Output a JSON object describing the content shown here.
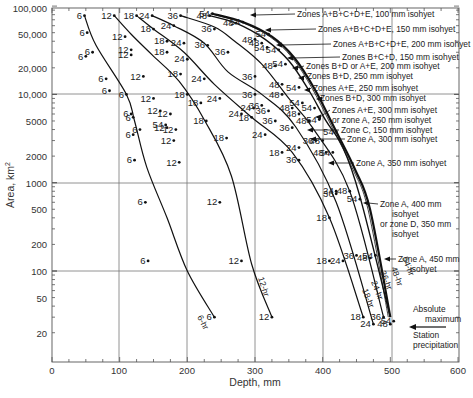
{
  "chart_data": {
    "type": "line",
    "title": "",
    "xlabel": "Depth, mm",
    "ylabel": "Area, km²",
    "xlim": [
      0,
      600
    ],
    "ylim": [
      10,
      100000
    ],
    "yscale": "log",
    "grid": true,
    "x_ticks": [
      "0",
      "100",
      "200",
      "300",
      "400",
      "500",
      "600"
    ],
    "y_ticks": [
      "100,000",
      "50,000",
      "20,000",
      "10,000",
      "5000",
      "2000",
      "1000",
      "500",
      "200",
      "100",
      "50",
      "20"
    ],
    "series": [
      {
        "name": "6-hr",
        "points": [
          [
            48,
            78000
          ],
          [
            65,
            36000
          ],
          [
            110,
            10000
          ],
          [
            122,
            5000
          ],
          [
            140,
            1500
          ],
          [
            170,
            400
          ],
          [
            200,
            100
          ],
          [
            240,
            30
          ]
        ]
      },
      {
        "name": "12-hr",
        "points": [
          [
            92,
            78000
          ],
          [
            117,
            48000
          ],
          [
            148,
            28000
          ],
          [
            188,
            14000
          ],
          [
            226,
            5000
          ],
          [
            265,
            1200
          ],
          [
            295,
            120
          ],
          [
            325,
            30
          ]
        ]
      },
      {
        "name": "18-hr",
        "points": [
          [
            125,
            78000
          ],
          [
            150,
            55000
          ],
          [
            195,
            30000
          ],
          [
            240,
            13000
          ],
          [
            295,
            5500
          ],
          [
            355,
            2200
          ],
          [
            410,
            400
          ],
          [
            460,
            30
          ]
        ]
      },
      {
        "name": "24-hr",
        "points": [
          [
            148,
            78000
          ],
          [
            180,
            60000
          ],
          [
            225,
            38000
          ],
          [
            260,
            18000
          ],
          [
            310,
            10000
          ],
          [
            360,
            4300
          ],
          [
            420,
            600
          ],
          [
            475,
            25
          ]
        ]
      },
      {
        "name": "36-hr",
        "points": [
          [
            190,
            78000
          ],
          [
            240,
            58000
          ],
          [
            270,
            40000
          ],
          [
            310,
            22000
          ],
          [
            350,
            9000
          ],
          [
            385,
            4200
          ],
          [
            440,
            800
          ],
          [
            490,
            30
          ]
        ]
      },
      {
        "name": "48-hr",
        "points": [
          [
            233,
            78000
          ],
          [
            272,
            64000
          ],
          [
            315,
            42000
          ],
          [
            350,
            24000
          ],
          [
            380,
            11000
          ],
          [
            405,
            5000
          ],
          [
            430,
            2500
          ],
          [
            455,
            700
          ],
          [
            500,
            30
          ]
        ]
      },
      {
        "name": "54-hr",
        "points": [
          [
            237,
            82000
          ],
          [
            282,
            66000
          ],
          [
            325,
            45000
          ],
          [
            358,
            26000
          ],
          [
            388,
            11500
          ],
          [
            420,
            3800
          ],
          [
            448,
            1400
          ],
          [
            470,
            500
          ],
          [
            500,
            30
          ]
        ]
      }
    ],
    "point_labels": [
      {
        "label": "6",
        "depth": 48,
        "area": 78000
      },
      {
        "label": "6",
        "depth": 52,
        "area": 50000
      },
      {
        "label": "6",
        "depth": 60,
        "area": 30000
      },
      {
        "label": "6",
        "depth": 50,
        "area": 27000
      },
      {
        "label": "6",
        "depth": 80,
        "area": 15000
      },
      {
        "label": "6",
        "depth": 85,
        "area": 11000
      },
      {
        "label": "6",
        "depth": 110,
        "area": 10000
      },
      {
        "label": "6",
        "depth": 117,
        "area": 6000
      },
      {
        "label": "6",
        "depth": 120,
        "area": 5500
      },
      {
        "label": "6",
        "depth": 130,
        "area": 4000
      },
      {
        "label": "6",
        "depth": 120,
        "area": 3500
      },
      {
        "label": "6",
        "depth": 122,
        "area": 1800
      },
      {
        "label": "6",
        "depth": 138,
        "area": 600
      },
      {
        "label": "6",
        "depth": 142,
        "area": 130
      },
      {
        "label": "6",
        "depth": 240,
        "area": 30
      },
      {
        "label": "12",
        "depth": 92,
        "area": 78000
      },
      {
        "label": "12",
        "depth": 108,
        "area": 45000
      },
      {
        "label": "12",
        "depth": 117,
        "area": 32000
      },
      {
        "label": "12",
        "depth": 117,
        "area": 28000
      },
      {
        "label": "12",
        "depth": 135,
        "area": 16000
      },
      {
        "label": "12",
        "depth": 150,
        "area": 9000
      },
      {
        "label": "12",
        "depth": 160,
        "area": 6500
      },
      {
        "label": "12",
        "depth": 175,
        "area": 6000
      },
      {
        "label": "12",
        "depth": 183,
        "area": 4000
      },
      {
        "label": "12",
        "depth": 170,
        "area": 4200
      },
      {
        "label": "12",
        "depth": 180,
        "area": 3000
      },
      {
        "label": "12",
        "depth": 188,
        "area": 1700
      },
      {
        "label": "12",
        "depth": 248,
        "area": 600
      },
      {
        "label": "12",
        "depth": 280,
        "area": 130
      },
      {
        "label": "12",
        "depth": 325,
        "area": 30
      },
      {
        "label": "18",
        "depth": 125,
        "area": 78000
      },
      {
        "label": "18",
        "depth": 150,
        "area": 55000
      },
      {
        "label": "18",
        "depth": 170,
        "area": 40000
      },
      {
        "label": "18",
        "depth": 170,
        "area": 30000
      },
      {
        "label": "18",
        "depth": 190,
        "area": 17000
      },
      {
        "label": "18",
        "depth": 200,
        "area": 10000
      },
      {
        "label": "18",
        "depth": 220,
        "area": 8000
      },
      {
        "label": "18",
        "depth": 228,
        "area": 5000
      },
      {
        "label": "18",
        "depth": 258,
        "area": 3200
      },
      {
        "label": "18",
        "depth": 295,
        "area": 5500
      },
      {
        "label": "18",
        "depth": 340,
        "area": 2200
      },
      {
        "label": "18",
        "depth": 410,
        "area": 400
      },
      {
        "label": "18",
        "depth": 410,
        "area": 130
      },
      {
        "label": "18",
        "depth": 460,
        "area": 30
      },
      {
        "label": "24",
        "depth": 148,
        "area": 78000
      },
      {
        "label": "24",
        "depth": 180,
        "area": 60000
      },
      {
        "label": "24",
        "depth": 195,
        "area": 38000
      },
      {
        "label": "24",
        "depth": 200,
        "area": 25000
      },
      {
        "label": "24",
        "depth": 225,
        "area": 15000
      },
      {
        "label": "24",
        "depth": 248,
        "area": 9000
      },
      {
        "label": "24",
        "depth": 280,
        "area": 6000
      },
      {
        "label": "24",
        "depth": 298,
        "area": 7000
      },
      {
        "label": "24",
        "depth": 315,
        "area": 3500
      },
      {
        "label": "24",
        "depth": 365,
        "area": 2500
      },
      {
        "label": "24",
        "depth": 420,
        "area": 800
      },
      {
        "label": "24",
        "depth": 430,
        "area": 130
      },
      {
        "label": "24",
        "depth": 475,
        "area": 25
      },
      {
        "label": "36",
        "depth": 190,
        "area": 78000
      },
      {
        "label": "36",
        "depth": 240,
        "area": 55000
      },
      {
        "label": "36",
        "depth": 230,
        "area": 36000
      },
      {
        "label": "36",
        "depth": 260,
        "area": 30000
      },
      {
        "label": "36",
        "depth": 300,
        "area": 16000
      },
      {
        "label": "36",
        "depth": 300,
        "area": 10000
      },
      {
        "label": "36",
        "depth": 310,
        "area": 7500
      },
      {
        "label": "36",
        "depth": 320,
        "area": 6500
      },
      {
        "label": "36",
        "depth": 330,
        "area": 5000
      },
      {
        "label": "36",
        "depth": 355,
        "area": 4200
      },
      {
        "label": "36",
        "depth": 390,
        "area": 3000
      },
      {
        "label": "36",
        "depth": 365,
        "area": 1800
      },
      {
        "label": "36",
        "depth": 420,
        "area": 750
      },
      {
        "label": "36",
        "depth": 450,
        "area": 150
      },
      {
        "label": "36",
        "depth": 490,
        "area": 30
      },
      {
        "label": "48",
        "depth": 233,
        "area": 78000
      },
      {
        "label": "48",
        "depth": 272,
        "area": 64000
      },
      {
        "label": "48",
        "depth": 300,
        "area": 42000
      },
      {
        "label": "48",
        "depth": 310,
        "area": 38000
      },
      {
        "label": "48",
        "depth": 330,
        "area": 21000
      },
      {
        "label": "48",
        "depth": 340,
        "area": 13000
      },
      {
        "label": "48",
        "depth": 340,
        "area": 10000
      },
      {
        "label": "48",
        "depth": 355,
        "area": 7000
      },
      {
        "label": "48",
        "depth": 365,
        "area": 6000
      },
      {
        "label": "48",
        "depth": 380,
        "area": 5000
      },
      {
        "label": "48",
        "depth": 400,
        "area": 3000
      },
      {
        "label": "48",
        "depth": 405,
        "area": 2200
      },
      {
        "label": "48",
        "depth": 440,
        "area": 800
      },
      {
        "label": "48",
        "depth": 470,
        "area": 140
      },
      {
        "label": "48",
        "depth": 500,
        "area": 25
      },
      {
        "label": "54",
        "depth": 237,
        "area": 82000
      },
      {
        "label": "54",
        "depth": 282,
        "area": 66000
      },
      {
        "label": "54",
        "depth": 320,
        "area": 48000
      },
      {
        "label": "54",
        "depth": 335,
        "area": 32000
      },
      {
        "label": "54",
        "depth": 318,
        "area": 34000
      },
      {
        "label": "54",
        "depth": 345,
        "area": 22000
      },
      {
        "label": "54",
        "depth": 365,
        "area": 12000
      },
      {
        "label": "54",
        "depth": 370,
        "area": 8000
      },
      {
        "label": "54",
        "depth": 388,
        "area": 7000
      },
      {
        "label": "54",
        "depth": 395,
        "area": 5200
      },
      {
        "label": "54",
        "depth": 420,
        "area": 3800
      },
      {
        "label": "54",
        "depth": 415,
        "area": 2200
      },
      {
        "label": "54",
        "depth": 455,
        "area": 650
      },
      {
        "label": "54",
        "depth": 168,
        "area": 4500
      },
      {
        "label": "54",
        "depth": 478,
        "area": 150
      },
      {
        "label": "54",
        "depth": 505,
        "area": 27
      }
    ],
    "annotations": [
      "Zones A+B+C+D+E, 100 mm isohyet",
      "Zones A+B+C+D+E, 150 mm isohyet",
      "Zones A+B+C+D+E, 200 mm isohyet",
      "Zones B+C+D, 150 mm isohyet",
      "Zones B+D or A+E, 200 mm isohyet",
      "Zones B+D, 250 mm isohyet",
      "Zones A+E, 250 mm isohyet",
      "Zones B+D, 300 mm isohyet",
      "Zones A+E, 300 mm isohyet or zone A, 250 mm isohyet",
      "Zone C, 150 mm isohyet",
      "Zone A, 300 mm isohyet",
      "Zone A, 350 mm isohyet",
      "Zone A, 400 mm isohyet or zone D, 350 mm isohyet",
      "Zone A, 450 mm isohyet",
      "Absolute maximum Station precipitation"
    ],
    "legend": "none (curves labeled inline: 6-hr, 12-hr, 18-hr, 24-hr, 36-hr, 48-hr, 54-hr)"
  },
  "axes": {
    "xlabel": "Depth, mm",
    "ylabel": "Area, km",
    "ylabel_sup": "2",
    "x_ticks": [
      {
        "label": "0",
        "x": 52
      },
      {
        "label": "100",
        "x": 119
      },
      {
        "label": "200",
        "x": 187
      },
      {
        "label": "300",
        "x": 255
      },
      {
        "label": "400",
        "x": 323
      },
      {
        "label": "500",
        "x": 392
      },
      {
        "label": "600",
        "x": 458
      }
    ],
    "y_ticks": [
      {
        "label": "100,000",
        "y": 8
      },
      {
        "label": "50,000",
        "y": 34
      },
      {
        "label": "20,000",
        "y": 68
      },
      {
        "label": "10,000",
        "y": 94
      },
      {
        "label": "5000",
        "y": 121
      },
      {
        "label": "2000",
        "y": 156
      },
      {
        "label": "1000",
        "y": 183
      },
      {
        "label": "500",
        "y": 209
      },
      {
        "label": "200",
        "y": 244
      },
      {
        "label": "100",
        "y": 271
      },
      {
        "label": "50",
        "y": 298
      },
      {
        "label": "20",
        "y": 333
      }
    ]
  },
  "curve_labels": [
    {
      "text": "6-hr",
      "x": 197,
      "y": 317,
      "rot": 62
    },
    {
      "text": "12-hr",
      "x": 258,
      "y": 278,
      "rot": 72
    },
    {
      "text": "18-hr",
      "x": 362,
      "y": 290,
      "rot": 68
    },
    {
      "text": "24-hr",
      "x": 371,
      "y": 282,
      "rot": 68
    },
    {
      "text": "36-hr",
      "x": 380,
      "y": 272,
      "rot": 68
    },
    {
      "text": "48-hr",
      "x": 391,
      "y": 268,
      "rot": 70
    },
    {
      "text": "54-hr",
      "x": 402,
      "y": 258,
      "rot": 68
    }
  ],
  "annotations": [
    {
      "lines": [
        "Zones A+B+C+D+E, 100 mm isohyet"
      ],
      "x": 297,
      "y": 17,
      "ax": 250,
      "ay": 15
    },
    {
      "lines": [
        "Zones A+B+C+D+E, 150 mm isohyet"
      ],
      "x": 318,
      "y": 32,
      "ax": 265,
      "ay": 30
    },
    {
      "lines": [
        "Zones A+B+C+D+E, 200 mm isohyet"
      ],
      "x": 333,
      "y": 47,
      "ax": 276,
      "ay": 45
    },
    {
      "lines": [
        "Zones B+C+D, 150 mm isohyet"
      ],
      "x": 342,
      "y": 60,
      "ax": 287,
      "ay": 58
    },
    {
      "lines": [
        "Zones B+D or A+E, 200 mm isohyet"
      ],
      "x": 306,
      "y": 69,
      "ax": 292,
      "ay": 68
    },
    {
      "lines": [
        "Zones B+D, 250 mm isohyet"
      ],
      "x": 307,
      "y": 79,
      "ax": 298,
      "ay": 78
    },
    {
      "lines": [
        "Zones A+E, 250 mm isohyet"
      ],
      "x": 313,
      "y": 91,
      "ax": 304,
      "ay": 90
    },
    {
      "lines": [
        "Zones B+D, 300 mm isohyet"
      ],
      "x": 320,
      "y": 101,
      "ax": 316,
      "ay": 99
    },
    {
      "lines": [
        "Zones A+E, 300 mm isohyet",
        "or zone A, 250 mm isohyet"
      ],
      "x": 332,
      "y": 113,
      "ax": 315,
      "ay": 117
    },
    {
      "lines": [
        "Zone C, 150 mm isohyet"
      ],
      "x": 341,
      "y": 133,
      "ax": 307,
      "ay": 130
    },
    {
      "lines": [
        "Zone A, 300 mm isohyet"
      ],
      "x": 347,
      "y": 142,
      "ax": 310,
      "ay": 139
    },
    {
      "lines": [
        "Zone A, 350 mm isohyet"
      ],
      "x": 356,
      "y": 166,
      "ax": 328,
      "ay": 163
    },
    {
      "lines": [
        "Zone A, 400 mm",
        "isohyet",
        "or zone D, 350 mm",
        "isohyet"
      ],
      "x": 380,
      "y": 207,
      "ax": 363,
      "ay": 203
    },
    {
      "lines": [
        "Zone A, 450 mm",
        "isohyet"
      ],
      "x": 398,
      "y": 262,
      "ax": 384,
      "ay": 259
    },
    {
      "lines": [
        "Absolute",
        "maximum"
      ],
      "x": 413,
      "y": 312,
      "ax": 0,
      "ay": 0
    },
    {
      "lines": [
        "Station",
        "precipitation"
      ],
      "x": 413,
      "y": 338,
      "ax": 0,
      "ay": 0
    }
  ],
  "absolute_max_arrow": {
    "x1": 446,
    "y1": 327,
    "x2": 409,
    "y2": 327
  }
}
